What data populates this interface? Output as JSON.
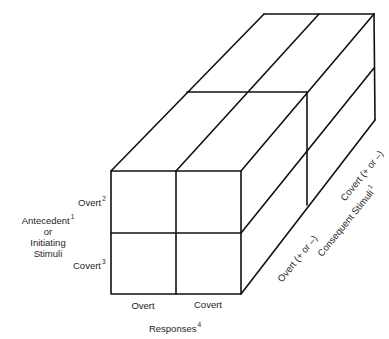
{
  "figure": {
    "type": "three-dimensional matrix (cube) diagram",
    "front_face": {
      "rows_label": {
        "line1": "Antecedent",
        "line1_footnote": "1",
        "line2": "or",
        "line3": "Initiating",
        "line4": "Stimuli"
      },
      "rows": [
        {
          "label": "Overt",
          "footnote": "2"
        },
        {
          "label": "Covert",
          "footnote": "3"
        }
      ],
      "columns": [
        {
          "label": "Overt"
        },
        {
          "label": "Covert"
        }
      ],
      "columns_label": {
        "text": "Responses",
        "footnote": "4"
      }
    },
    "depth_axis": {
      "label": {
        "text": "Consequent Stimuli",
        "footnote": "1"
      },
      "slices": [
        {
          "label": "Overt (+ or –)"
        },
        {
          "label": "Covert (+ or –)"
        }
      ]
    },
    "line_color": "#111111"
  }
}
